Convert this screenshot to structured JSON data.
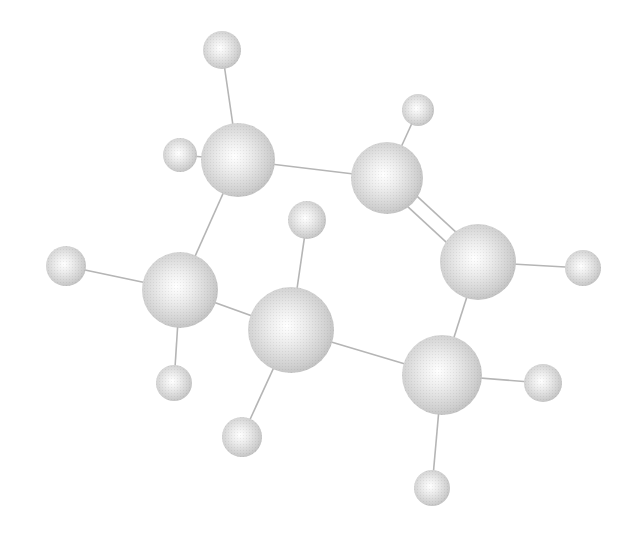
{
  "figure": {
    "background": "#ffffff",
    "atom_color": "#c8c8c8",
    "highlight_color": "#ffffff",
    "bond_color": "#b5b5b5"
  },
  "atoms": [
    {
      "id": "C1",
      "type": "carbon",
      "x": 238,
      "y": 160,
      "r": 37
    },
    {
      "id": "C2",
      "type": "carbon",
      "x": 387,
      "y": 178,
      "r": 36
    },
    {
      "id": "C3",
      "type": "carbon",
      "x": 478,
      "y": 262,
      "r": 38
    },
    {
      "id": "C4",
      "type": "carbon",
      "x": 442,
      "y": 375,
      "r": 40
    },
    {
      "id": "C5",
      "type": "carbon",
      "x": 291,
      "y": 330,
      "r": 43
    },
    {
      "id": "C6",
      "type": "carbon",
      "x": 180,
      "y": 290,
      "r": 38
    },
    {
      "id": "H1",
      "type": "hydrogen",
      "x": 222,
      "y": 50,
      "r": 19
    },
    {
      "id": "H2",
      "type": "hydrogen",
      "x": 180,
      "y": 155,
      "r": 17
    },
    {
      "id": "H3",
      "type": "hydrogen",
      "x": 418,
      "y": 110,
      "r": 16
    },
    {
      "id": "H4",
      "type": "hydrogen",
      "x": 583,
      "y": 268,
      "r": 18
    },
    {
      "id": "H5",
      "type": "hydrogen",
      "x": 543,
      "y": 383,
      "r": 19
    },
    {
      "id": "H6",
      "type": "hydrogen",
      "x": 432,
      "y": 488,
      "r": 18
    },
    {
      "id": "H7",
      "type": "hydrogen",
      "x": 307,
      "y": 220,
      "r": 19
    },
    {
      "id": "H8",
      "type": "hydrogen",
      "x": 242,
      "y": 437,
      "r": 20
    },
    {
      "id": "H9",
      "type": "hydrogen",
      "x": 66,
      "y": 266,
      "r": 20
    },
    {
      "id": "H10",
      "type": "hydrogen",
      "x": 174,
      "y": 383,
      "r": 18
    }
  ],
  "bonds": [
    {
      "from": "C1",
      "to": "C2",
      "order": 1
    },
    {
      "from": "C2",
      "to": "C3",
      "order": 2
    },
    {
      "from": "C3",
      "to": "C4",
      "order": 1
    },
    {
      "from": "C4",
      "to": "C5",
      "order": 1
    },
    {
      "from": "C5",
      "to": "C6",
      "order": 1
    },
    {
      "from": "C6",
      "to": "C1",
      "order": 1
    },
    {
      "from": "C1",
      "to": "H1",
      "order": 1
    },
    {
      "from": "C1",
      "to": "H2",
      "order": 1
    },
    {
      "from": "C2",
      "to": "H3",
      "order": 1
    },
    {
      "from": "C3",
      "to": "H4",
      "order": 1
    },
    {
      "from": "C4",
      "to": "H5",
      "order": 1
    },
    {
      "from": "C4",
      "to": "H6",
      "order": 1
    },
    {
      "from": "C5",
      "to": "H7",
      "order": 1
    },
    {
      "from": "C5",
      "to": "H8",
      "order": 1
    },
    {
      "from": "C6",
      "to": "H9",
      "order": 1
    },
    {
      "from": "C6",
      "to": "H10",
      "order": 1
    }
  ]
}
